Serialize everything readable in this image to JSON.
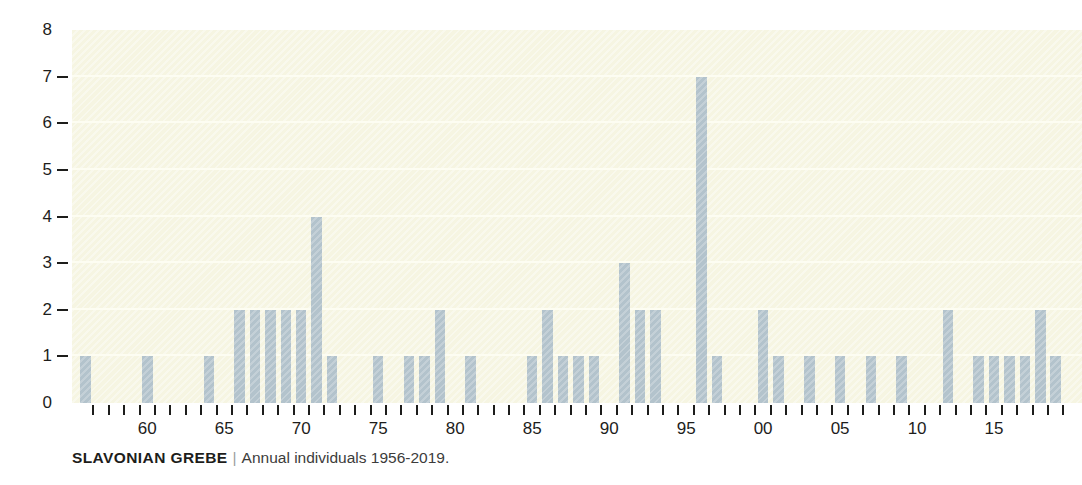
{
  "caption": {
    "species": "SLAVONIAN GREBE",
    "separator": "|",
    "description": "Annual individuals 1956-2019."
  },
  "colors": {
    "bar": "#b3c3cc",
    "plot_background": "#f6f5e2",
    "gridline": "#fdfdf2",
    "axis_text": "#1d1d1b"
  },
  "chart_data": {
    "type": "bar",
    "xlabel": "",
    "ylabel": "",
    "ylim": [
      0,
      8
    ],
    "y_ticks": [
      0,
      1,
      2,
      3,
      4,
      5,
      6,
      7,
      8
    ],
    "grid": true,
    "legend": "none",
    "x_tick_labels": [
      "60",
      "65",
      "70",
      "75",
      "80",
      "85",
      "90",
      "95",
      "00",
      "05",
      "10",
      "15"
    ],
    "x_tick_label_years": [
      1960,
      1965,
      1970,
      1975,
      1980,
      1985,
      1990,
      1995,
      2000,
      2005,
      2010,
      2015
    ],
    "categories": [
      1956,
      1957,
      1958,
      1959,
      1960,
      1961,
      1962,
      1963,
      1964,
      1965,
      1966,
      1967,
      1968,
      1969,
      1970,
      1971,
      1972,
      1973,
      1974,
      1975,
      1976,
      1977,
      1978,
      1979,
      1980,
      1981,
      1982,
      1983,
      1984,
      1985,
      1986,
      1987,
      1988,
      1989,
      1990,
      1991,
      1992,
      1993,
      1994,
      1995,
      1996,
      1997,
      1998,
      1999,
      2000,
      2001,
      2002,
      2003,
      2004,
      2005,
      2006,
      2007,
      2008,
      2009,
      2010,
      2011,
      2012,
      2013,
      2014,
      2015,
      2016,
      2017,
      2018,
      2019
    ],
    "values": [
      1,
      0,
      0,
      0,
      1,
      0,
      0,
      0,
      1,
      0,
      2,
      2,
      2,
      2,
      2,
      4,
      1,
      0,
      0,
      1,
      0,
      1,
      1,
      2,
      0,
      1,
      0,
      0,
      0,
      1,
      2,
      1,
      1,
      1,
      0,
      3,
      2,
      2,
      0,
      0,
      7,
      1,
      0,
      0,
      2,
      1,
      0,
      1,
      0,
      1,
      0,
      1,
      0,
      1,
      0,
      0,
      2,
      0,
      1,
      1,
      1,
      1,
      2,
      1
    ]
  }
}
